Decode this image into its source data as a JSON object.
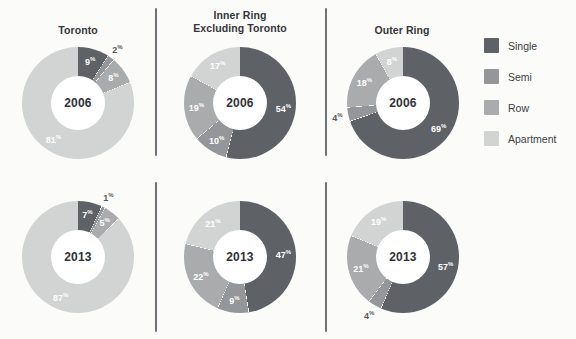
{
  "legend": {
    "items": [
      {
        "label": "Single",
        "color": "#5e6166"
      },
      {
        "label": "Semi",
        "color": "#949699"
      },
      {
        "label": "Row",
        "color": "#a9abad"
      },
      {
        "label": "Apartment",
        "color": "#d2d4d4"
      }
    ]
  },
  "panels": [
    {
      "title": "Toronto",
      "title_line1": "Toronto",
      "title_line2": ""
    },
    {
      "title": "Inner Ring Excluding Toronto",
      "title_line1": "Inner Ring",
      "title_line2": "Excluding Toronto"
    },
    {
      "title": "Outer Ring",
      "title_line1": "Outer Ring",
      "title_line2": ""
    }
  ],
  "years": [
    "2006",
    "2013"
  ],
  "labels": {
    "toronto_2006": {
      "single": "9",
      "semi": "2",
      "row": "8",
      "apartment": "81"
    },
    "toronto_2013": {
      "single": "7",
      "semi": "1",
      "row": "5",
      "apartment": "87"
    },
    "inner_2006": {
      "single": "54",
      "semi": "10",
      "row": "19",
      "apartment": "17"
    },
    "inner_2013": {
      "single": "47",
      "semi": "9",
      "row": "22",
      "apartment": "21"
    },
    "outer_2006": {
      "single": "69",
      "semi": "4",
      "row": "18",
      "apartment": "8"
    },
    "outer_2013": {
      "single": "57",
      "semi": "4",
      "row": "21",
      "apartment": "19"
    }
  },
  "percent_symbol": "%",
  "chart_data": {
    "type": "pie",
    "categories": [
      "Single",
      "Semi",
      "Row",
      "Apartment"
    ],
    "category_colors": [
      "#5e6166",
      "#949699",
      "#a9abad",
      "#d2d4d4"
    ],
    "unit": "%",
    "legend_position": "right",
    "slice_order": "clockwise from 12 o'clock: Single, Semi, Row, Apartment",
    "charts": [
      {
        "panel": "Toronto",
        "year": "2006",
        "values": [
          9,
          2,
          8,
          81
        ]
      },
      {
        "panel": "Toronto",
        "year": "2013",
        "values": [
          7,
          1,
          5,
          87
        ]
      },
      {
        "panel": "Inner Ring Excluding Toronto",
        "year": "2006",
        "values": [
          54,
          10,
          19,
          17
        ]
      },
      {
        "panel": "Inner Ring Excluding Toronto",
        "year": "2013",
        "values": [
          47,
          9,
          22,
          21
        ]
      },
      {
        "panel": "Outer Ring",
        "year": "2006",
        "values": [
          69,
          4,
          18,
          8
        ]
      },
      {
        "panel": "Outer Ring",
        "year": "2013",
        "values": [
          57,
          4,
          21,
          19
        ]
      }
    ]
  }
}
